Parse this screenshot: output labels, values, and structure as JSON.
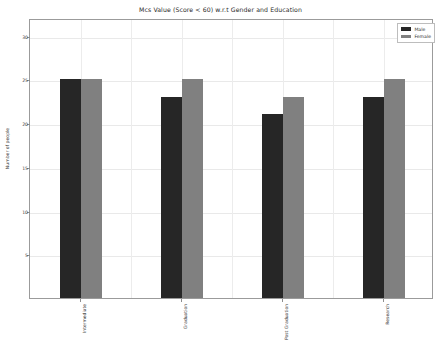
{
  "chart_data": {
    "type": "bar",
    "title": "Mcs Value (Score < 60) w.r.t Gender and Education",
    "xlabel": "",
    "ylabel": "Number of people",
    "categories": [
      "Intermediate",
      "Graduation",
      "Post Graduation",
      "Research"
    ],
    "series": [
      {
        "name": "Male",
        "color": "#262626",
        "values": [
          25,
          23,
          21,
          23
        ]
      },
      {
        "name": "Female",
        "color": "#808080",
        "values": [
          25,
          25,
          23,
          25
        ]
      }
    ],
    "ylim": [
      0,
      32
    ],
    "yticks": [
      5,
      10,
      15,
      20,
      25,
      30
    ],
    "ytick_labels": [
      "5",
      "10",
      "15",
      "20",
      "25",
      "30"
    ],
    "grid": true,
    "legend_position": "upper right"
  },
  "legend": {
    "entries": [
      {
        "label": "Male"
      },
      {
        "label": "Female"
      }
    ]
  }
}
